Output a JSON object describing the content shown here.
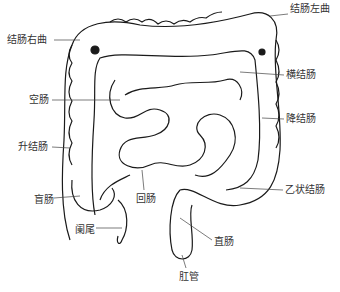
{
  "diagram": {
    "labels": [
      {
        "id": "left-colic-flexure",
        "text": "结肠左曲",
        "x": 290,
        "y": 9
      },
      {
        "id": "right-colic-flexure",
        "text": "结肠右曲",
        "x": 7,
        "y": 34
      },
      {
        "id": "transverse-colon",
        "text": "横结肠",
        "x": 286,
        "y": 69
      },
      {
        "id": "jejunum",
        "text": "空肠",
        "x": 29,
        "y": 94
      },
      {
        "id": "descending-colon",
        "text": "降结肠",
        "x": 286,
        "y": 113
      },
      {
        "id": "ascending-colon",
        "text": "升结肠",
        "x": 18,
        "y": 141
      },
      {
        "id": "cecum",
        "text": "盲肠",
        "x": 34,
        "y": 194
      },
      {
        "id": "ileum",
        "text": "回肠",
        "x": 136,
        "y": 193
      },
      {
        "id": "sigmoid-colon",
        "text": "乙状结肠",
        "x": 285,
        "y": 184
      },
      {
        "id": "appendix",
        "text": "阑尾",
        "x": 75,
        "y": 224
      },
      {
        "id": "rectum",
        "text": "直肠",
        "x": 214,
        "y": 236
      },
      {
        "id": "anal-canal",
        "text": "肛管",
        "x": 179,
        "y": 271
      }
    ],
    "colors": {
      "line": "#1a1a1a",
      "text": "#333333",
      "background": "#ffffff"
    }
  }
}
